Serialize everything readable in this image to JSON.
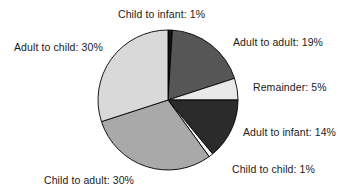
{
  "chart_data": {
    "type": "pie",
    "title": "",
    "legend_position": "labels-around-slices",
    "units": "percent",
    "total": 100,
    "center": {
      "cx": 168,
      "cy": 100,
      "r": 70
    },
    "start_angle_deg": -90,
    "direction": "clockwise",
    "categories": [
      "Child to infant",
      "Adult to adult",
      "Remainder",
      "Adult to infant",
      "Child to child",
      "Child to adult",
      "Adult to child"
    ],
    "values": [
      1,
      19,
      5,
      14,
      1,
      30,
      30
    ],
    "slices": [
      {
        "key": "child-to-infant",
        "name": "Child to infant",
        "value": 1,
        "label": "Child to infant: 1%",
        "color": "#111111",
        "stroke": "#000000"
      },
      {
        "key": "adult-to-adult",
        "name": "Adult to adult",
        "value": 19,
        "label": "Adult to adult: 19%",
        "color": "#565656",
        "stroke": "#000000"
      },
      {
        "key": "remainder",
        "name": "Remainder",
        "value": 5,
        "label": "Remainder: 5%",
        "color": "#e9e9e9",
        "stroke": "#000000"
      },
      {
        "key": "adult-to-infant",
        "name": "Adult to infant",
        "value": 14,
        "label": "Adult to infant: 14%",
        "color": "#2b2b2b",
        "stroke": "#000000"
      },
      {
        "key": "child-to-child",
        "name": "Child to child",
        "value": 1,
        "label": "Child to child: 1%",
        "color": "#fbfbfb",
        "stroke": "#000000"
      },
      {
        "key": "child-to-adult",
        "name": "Child to adult",
        "value": 30,
        "label": "Child to adult: 30%",
        "color": "#a9a9a9",
        "stroke": "#000000"
      },
      {
        "key": "adult-to-child",
        "name": "Adult to child",
        "value": 30,
        "label": "Adult to child: 30%",
        "color": "#d9d9d9",
        "stroke": "#000000"
      }
    ]
  },
  "labels": {
    "child_to_infant": "Child to infant: 1%",
    "adult_to_adult": "Adult to adult: 19%",
    "remainder": "Remainder: 5%",
    "adult_to_infant": "Adult to infant: 14%",
    "child_to_child": "Child to child: 1%",
    "child_to_adult": "Child to adult: 30%",
    "adult_to_child": "Adult to child: 30%"
  }
}
